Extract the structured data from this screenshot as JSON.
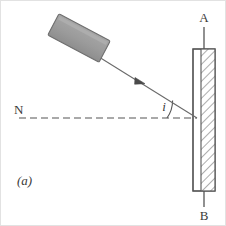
{
  "figure": {
    "caption": "(a)",
    "labels": {
      "normal": "N",
      "angle_of_incidence": "i",
      "mirror_top": "A",
      "mirror_bottom": "B"
    },
    "colors": {
      "line": "#555555",
      "block_fill": "#9c9c9c",
      "block_stroke": "#6e6e6e",
      "hatch": "#8a8a8a",
      "glass_fill": "#ffffff",
      "background": "#ffffff",
      "text": "#3a3a3a"
    },
    "geometry": {
      "canvas": {
        "width": 226,
        "height": 226
      },
      "mirror": {
        "x": 192,
        "y": 48,
        "width": 22,
        "height": 142,
        "hatch_start_x": 200
      },
      "axis_line_x": 203,
      "axis_top_y": 26,
      "axis_bottom_y": 206,
      "normal_line": {
        "x1": 18,
        "x2": 196,
        "y": 117
      },
      "incident_ray": {
        "x1": 98,
        "y1": 56,
        "x2": 196,
        "y2": 117
      },
      "arrow_at": {
        "x": 138,
        "y": 81
      },
      "block": {
        "cx": 78,
        "cy": 37,
        "width": 58,
        "height": 24,
        "rotation_deg": 28
      },
      "angle_arc": {
        "center_x": 196,
        "center_y": 117,
        "radius": 30
      }
    }
  }
}
